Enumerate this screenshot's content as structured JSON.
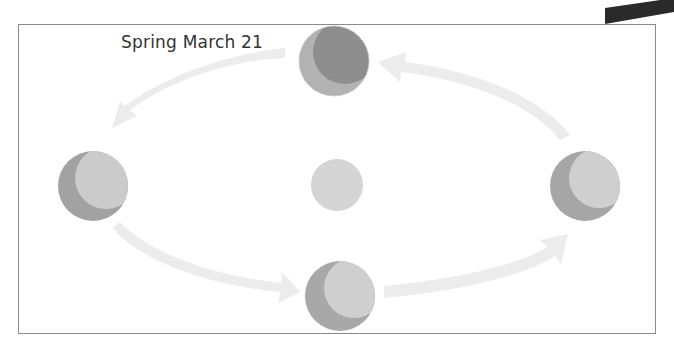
{
  "diagram": {
    "label": "Spring March 21",
    "colors": {
      "frame": "#8a8a8a",
      "arrow": "#ececec",
      "sun": "#d2d2d2",
      "earth_dark": "#9a9a9a",
      "earth_light": "#c4c4c4",
      "earth_top_dark": "#8c8c8c",
      "corner_shape": "#2a2a2a"
    },
    "bodies": [
      {
        "name": "sun",
        "cx": 337,
        "cy": 185,
        "r": 26
      },
      {
        "name": "earth-top",
        "cx": 334,
        "cy": 61,
        "r": 35
      },
      {
        "name": "earth-left",
        "cx": 93,
        "cy": 186,
        "r": 35
      },
      {
        "name": "earth-right",
        "cx": 585,
        "cy": 186,
        "r": 35
      },
      {
        "name": "earth-bottom",
        "cx": 340,
        "cy": 296,
        "r": 35
      }
    ]
  }
}
